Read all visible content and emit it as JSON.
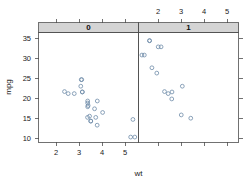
{
  "chart_data": {
    "type": "scatter",
    "title": "",
    "xlabel": "wt",
    "ylabel": "mpg",
    "xlim": [
      1.37,
      5.58
    ],
    "ylim": [
      9.2,
      35.9
    ],
    "grid": false,
    "legend_position": "none",
    "conditioned_by": "am",
    "panel_strip_labels": [
      "0",
      "1"
    ],
    "x_ticks": [
      2,
      3,
      4,
      5
    ],
    "x_tick_labels": [
      "2",
      "3",
      "4",
      "5"
    ],
    "y_ticks": [
      10,
      15,
      20,
      25,
      30,
      35
    ],
    "y_tick_labels": [
      "10",
      "15",
      "20",
      "25",
      "30",
      "35"
    ],
    "panels": [
      {
        "strip_label": "0",
        "axis_side": "bottom",
        "x": [
          2.62,
          2.875,
          3.215,
          3.44,
          3.46,
          3.57,
          3.19,
          3.15,
          3.44,
          3.44,
          4.07,
          3.73,
          3.78,
          5.25,
          5.424,
          5.345,
          2.465,
          3.52,
          3.435,
          3.84,
          3.845,
          3.17,
          3.57,
          3.215
        ],
        "y": [
          21.0,
          21.0,
          21.4,
          18.7,
          18.1,
          14.3,
          24.4,
          22.8,
          19.2,
          17.8,
          16.4,
          17.3,
          15.2,
          10.4,
          10.4,
          14.7,
          21.5,
          15.5,
          15.2,
          13.3,
          19.2,
          24.4,
          14.3,
          21.4
        ],
        "count": 19
      },
      {
        "strip_label": "1",
        "axis_side": "top",
        "x": [
          2.32,
          3.215,
          1.615,
          1.835,
          2.465,
          1.935,
          2.14,
          1.513,
          3.17,
          2.77,
          3.57,
          2.78,
          1.835,
          2.2,
          2.62
        ],
        "y": [
          32.4,
          22.8,
          30.4,
          33.9,
          21.5,
          27.3,
          26.0,
          30.4,
          15.8,
          19.7,
          15.0,
          21.4,
          33.9,
          32.4,
          21.0
        ],
        "count": 13
      }
    ]
  },
  "axes": {
    "x_title": "wt",
    "y_title": "mpg"
  }
}
